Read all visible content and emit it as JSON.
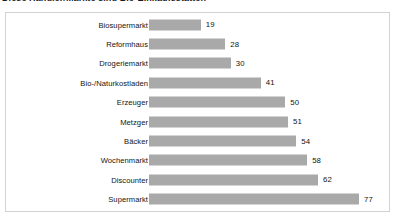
{
  "title": {
    "text": "Diese Händler/Märkte sind Bio-Einkaufsstätten",
    "clipped": true
  },
  "chart_data": {
    "type": "bar",
    "orientation": "horizontal",
    "title": "",
    "xlabel": "",
    "ylabel": "",
    "grid": false,
    "legend": false,
    "xlim": [
      0,
      77
    ],
    "categories": [
      "Biosupermarkt",
      "Reformhaus",
      "Drogeriemarkt",
      "Bio-/Naturkostladen",
      "Erzeuger",
      "Metzger",
      "Bäcker",
      "Wochenmarkt",
      "Discounter",
      "Supermarkt"
    ],
    "values": [
      19,
      28,
      30,
      41,
      50,
      51,
      54,
      58,
      62,
      77
    ],
    "value_labels": [
      "19",
      "28",
      "30",
      "41",
      "50",
      "51",
      "54",
      "58",
      "62",
      "77"
    ],
    "bar_color": "#a9a9a9",
    "frame_color": "#d2d2d2",
    "background": "#ffffff",
    "text_color": "#141414"
  }
}
